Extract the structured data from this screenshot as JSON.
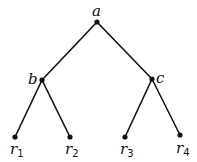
{
  "tree": {
    "nodes": [
      {
        "id": "a",
        "label": "a",
        "sub": "",
        "x": 97,
        "y": 22,
        "lx": 92,
        "ly": 16
      },
      {
        "id": "b",
        "label": "b",
        "sub": "",
        "x": 42,
        "y": 80,
        "lx": 28,
        "ly": 84
      },
      {
        "id": "c",
        "label": "c",
        "sub": "",
        "x": 152,
        "y": 79,
        "lx": 156,
        "ly": 83
      },
      {
        "id": "r1",
        "label": "r",
        "sub": "1",
        "x": 15,
        "y": 137,
        "lx": 10,
        "ly": 154
      },
      {
        "id": "r2",
        "label": "r",
        "sub": "2",
        "x": 70,
        "y": 137,
        "lx": 65,
        "ly": 154
      },
      {
        "id": "r3",
        "label": "r",
        "sub": "3",
        "x": 125,
        "y": 137,
        "lx": 120,
        "ly": 154
      },
      {
        "id": "r4",
        "label": "r",
        "sub": "4",
        "x": 180,
        "y": 135,
        "lx": 176,
        "ly": 153
      }
    ],
    "edges": [
      [
        "a",
        "b"
      ],
      [
        "a",
        "c"
      ],
      [
        "b",
        "r1"
      ],
      [
        "b",
        "r2"
      ],
      [
        "c",
        "r3"
      ],
      [
        "c",
        "r4"
      ]
    ]
  }
}
